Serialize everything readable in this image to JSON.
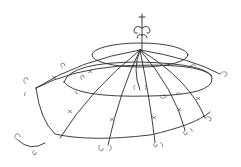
{
  "image": {
    "subject": "wire canopy sculpture sketch",
    "background_color": "#ffffff",
    "stroke_color": "#2a2a2a"
  }
}
